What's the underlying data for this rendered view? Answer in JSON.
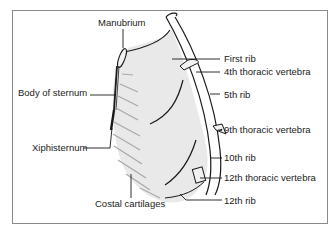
{
  "figure": {
    "labels": {
      "manubrium": "Manubrium",
      "body_of_sternum": "Body of sternum",
      "xiphisternum": "Xiphisternum",
      "costal_cartilages": "Costal cartilages",
      "first_rib": "First rib",
      "fourth_thoracic_vertebra": "4th thoracic vertebra",
      "fifth_rib": "5th rib",
      "ninth_thoracic_vertebra": "9th thoracic vertebra",
      "tenth_rib": "10th rib",
      "twelfth_thoracic_vertebra": "12th thoracic vertebra",
      "twelfth_rib": "12th rib"
    },
    "colors": {
      "frame": "#8a8a8a",
      "outline": "#1a1a1a",
      "shading": "#e6e6e6",
      "cartilage": "#a8a8a8"
    }
  }
}
